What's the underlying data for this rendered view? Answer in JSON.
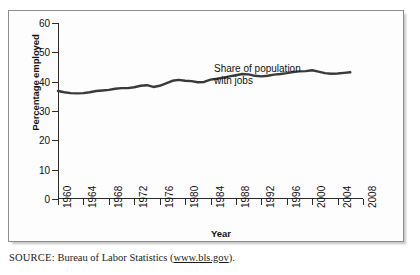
{
  "figure": {
    "source_label": "SOURCE:",
    "source_text": " Bureau of Labor Statistics (",
    "source_url": "www.bls.gov",
    "source_suffix": ")."
  },
  "chart_data": {
    "type": "line",
    "title": "",
    "xlabel": "Year",
    "ylabel": "Percentage employed",
    "annotation": "Share of population\nwith jobs",
    "xlim": [
      1960,
      2008
    ],
    "ylim": [
      0,
      60
    ],
    "yticks": [
      0,
      10,
      20,
      30,
      40,
      50,
      60
    ],
    "xticks": [
      1960,
      1964,
      1968,
      1972,
      1976,
      1980,
      1984,
      1988,
      1992,
      1996,
      2000,
      2004,
      2008
    ],
    "grid": false,
    "legend": "none",
    "line_color": "#3a3a3a",
    "series": [
      {
        "name": "Share of population with jobs",
        "x": [
          1960,
          1961,
          1962,
          1963,
          1964,
          1965,
          1966,
          1967,
          1968,
          1969,
          1970,
          1971,
          1972,
          1973,
          1974,
          1975,
          1976,
          1977,
          1978,
          1979,
          1980,
          1981,
          1982,
          1983,
          1984,
          1985,
          1986,
          1987,
          1988,
          1989,
          1990,
          1991,
          1992,
          1993,
          1994,
          1995,
          1996,
          1997,
          1998,
          1999,
          2000,
          2001,
          2002,
          2003,
          2004,
          2005,
          2006
        ],
        "values": [
          36.8,
          36.4,
          36.1,
          36.0,
          36.1,
          36.4,
          36.8,
          37.0,
          37.2,
          37.6,
          37.8,
          37.8,
          38.1,
          38.6,
          38.8,
          38.2,
          38.6,
          39.4,
          40.3,
          40.6,
          40.3,
          40.2,
          39.8,
          39.9,
          40.7,
          41.0,
          41.4,
          41.8,
          42.2,
          42.6,
          42.5,
          42.0,
          41.8,
          42.0,
          42.4,
          42.6,
          42.9,
          43.3,
          43.5,
          43.6,
          43.9,
          43.4,
          42.9,
          42.7,
          42.8,
          43.0,
          43.2
        ]
      }
    ]
  }
}
